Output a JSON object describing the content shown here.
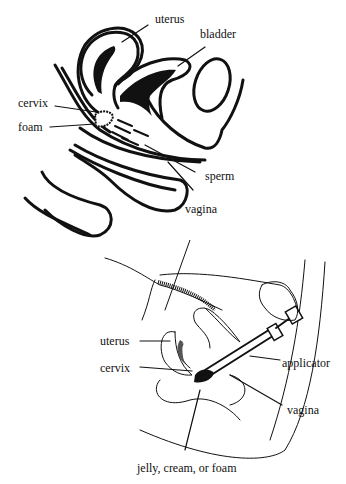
{
  "figures": [
    {
      "id": "foam-in-vagina",
      "labels": {
        "uterus": "uterus",
        "bladder": "bladder",
        "cervix": "cervix",
        "foam": "foam",
        "sperm": "sperm",
        "vagina": "vagina"
      }
    },
    {
      "id": "applicator-insertion",
      "labels": {
        "uterus": "uterus",
        "cervix": "cervix",
        "applicator": "applicator",
        "vagina": "vagina",
        "product": "jelly, cream, or foam"
      }
    }
  ]
}
